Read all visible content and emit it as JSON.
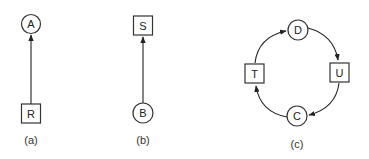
{
  "panels": [
    {
      "caption": "(a)",
      "nodes": [
        {
          "id": "A",
          "label": "A",
          "shape": "circle"
        },
        {
          "id": "R",
          "label": "R",
          "shape": "square"
        }
      ],
      "edges": [
        {
          "from": "R",
          "to": "A"
        }
      ]
    },
    {
      "caption": "(b)",
      "nodes": [
        {
          "id": "S",
          "label": "S",
          "shape": "square"
        },
        {
          "id": "B",
          "label": "B",
          "shape": "circle"
        }
      ],
      "edges": [
        {
          "from": "B",
          "to": "S"
        }
      ]
    },
    {
      "caption": "(c)",
      "nodes": [
        {
          "id": "D",
          "label": "D",
          "shape": "circle"
        },
        {
          "id": "U",
          "label": "U",
          "shape": "square"
        },
        {
          "id": "C",
          "label": "C",
          "shape": "circle"
        },
        {
          "id": "T",
          "label": "T",
          "shape": "square"
        }
      ],
      "edges": [
        {
          "from": "D",
          "to": "U"
        },
        {
          "from": "U",
          "to": "C"
        },
        {
          "from": "C",
          "to": "T"
        },
        {
          "from": "T",
          "to": "D"
        }
      ]
    }
  ],
  "colors": {
    "stroke": "#333333",
    "background": "#ffffff"
  }
}
